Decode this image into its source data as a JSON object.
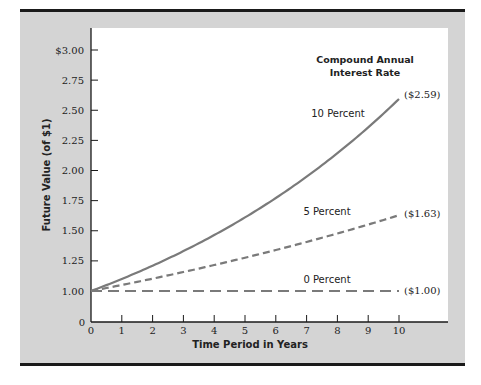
{
  "chart_data": {
    "type": "line",
    "title": "",
    "xlabel": "Time Period in Years",
    "ylabel": "Future Value (of $1)",
    "legend_title": "Compound Annual Interest Rate",
    "legend_title_lines": [
      "Compound Annual",
      "Interest Rate"
    ],
    "x": [
      0,
      1,
      2,
      3,
      4,
      5,
      6,
      7,
      8,
      9,
      10
    ],
    "x_ticks": [
      "0",
      "1",
      "2",
      "3",
      "4",
      "5",
      "6",
      "7",
      "8",
      "9",
      "10"
    ],
    "y_ticks": [
      "$3.00",
      "2.75",
      "2.50",
      "2.25",
      "2.00",
      "1.75",
      "1.50",
      "1.25",
      "1.00",
      "0"
    ],
    "y_tick_values": [
      3.0,
      2.75,
      2.5,
      2.25,
      2.0,
      1.75,
      1.5,
      1.25,
      1.0,
      0
    ],
    "ylim": [
      0,
      3.0
    ],
    "xlim": [
      0,
      10
    ],
    "grid": false,
    "series": [
      {
        "name": "10 Percent",
        "style": "solid",
        "values": [
          1.0,
          1.1,
          1.21,
          1.331,
          1.4641,
          1.6105,
          1.7716,
          1.9487,
          2.1436,
          2.3579,
          2.5937
        ],
        "end_label": "($2.59)"
      },
      {
        "name": "5 Percent",
        "style": "dashed",
        "values": [
          1.0,
          1.05,
          1.1025,
          1.1576,
          1.2155,
          1.2763,
          1.3401,
          1.4071,
          1.4775,
          1.5513,
          1.6289
        ],
        "end_label": "($1.63)"
      },
      {
        "name": "0 Percent",
        "style": "long-dashed",
        "values": [
          1.0,
          1.0,
          1.0,
          1.0,
          1.0,
          1.0,
          1.0,
          1.0,
          1.0,
          1.0,
          1.0
        ],
        "end_label": "($1.00)"
      }
    ]
  },
  "colors": {
    "panel": "#d4d4d4",
    "plot_bg": "#ffffff",
    "rule": "#1a1a1a",
    "line": "#7a7a7a",
    "text": "#222222"
  }
}
